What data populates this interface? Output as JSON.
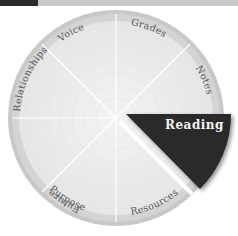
{
  "header": {
    "bar_accent": "#2a2a2a",
    "bar_color": "#c9c9c9"
  },
  "wheel": {
    "segments": [
      {
        "label": "Grades",
        "selected": false
      },
      {
        "label": "Notes",
        "selected": false
      },
      {
        "label": "Reading",
        "selected": true
      },
      {
        "label": "Resources",
        "selected": false
      },
      {
        "label": "Purpose",
        "selected": false
      },
      {
        "label": "Future",
        "selected": false
      },
      {
        "label": "Relationships",
        "selected": false
      },
      {
        "label": "Voice",
        "selected": false
      }
    ],
    "colors": {
      "ring": "#c8c8c8",
      "face": "#ececec",
      "selected": "#2b2b2b",
      "selected_text": "#f4f4f4",
      "divider": "#ffffff"
    }
  }
}
